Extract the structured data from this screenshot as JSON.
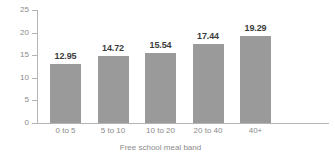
{
  "chart_data": {
    "type": "bar",
    "title": "",
    "subtitle": "",
    "xlabel": "Free school meal band",
    "ylabel": "",
    "categories": [
      "0 to 5",
      "5 to 10",
      "10 to 20",
      "20 to 40",
      "40+"
    ],
    "values": [
      12.95,
      14.72,
      15.54,
      17.44,
      19.29
    ],
    "value_labels": [
      "12.95",
      "14.72",
      "15.54",
      "17.44",
      "19.29"
    ],
    "ylim": [
      0,
      25
    ],
    "yticks": [
      0,
      5,
      10,
      15,
      20,
      25
    ],
    "ytick_labels": [
      "0",
      "5",
      "10",
      "15",
      "20",
      "25"
    ],
    "grid": false,
    "legend": null,
    "legend_position": "none",
    "series": [
      {
        "name": "",
        "values": [
          12.95,
          14.72,
          15.54,
          17.44,
          19.29
        ],
        "color": "#9a9a9a"
      }
    ]
  },
  "style": {
    "bar_color": "#9a9a9a",
    "axis_color": "#b4b4b4",
    "tick_label_color": "#8a8a8a",
    "value_label_color": "#3c3c3c",
    "background": "#ffffff"
  }
}
